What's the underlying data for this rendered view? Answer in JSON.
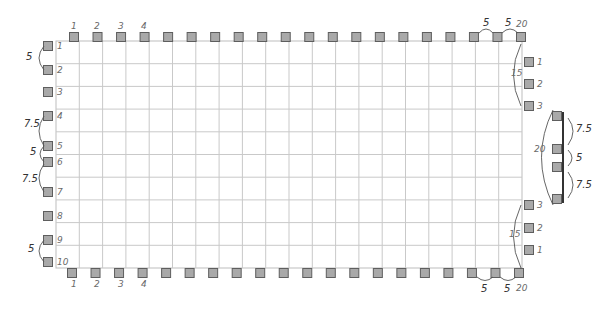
{
  "diagram": {
    "colors": {
      "square_fill": "#a9a9a9",
      "square_border": "#5e5e5e",
      "grid_line": "#c9c9c9",
      "annotation": "#333333"
    },
    "grid": {
      "columns": 20,
      "rows": 10
    },
    "top_edge": {
      "square_count": 20,
      "labels": [
        "1",
        "2",
        "3",
        "4"
      ],
      "end_annotations": [
        "5",
        "5",
        "20"
      ]
    },
    "bottom_edge": {
      "square_count": 20,
      "labels": [
        "1",
        "2",
        "3",
        "4"
      ],
      "end_annotations": [
        "5",
        "5",
        "20"
      ]
    },
    "left_edge": {
      "square_labels": [
        "1",
        "2",
        "3",
        "4",
        "5",
        "6",
        "7",
        "8",
        "9",
        "10"
      ],
      "spacing_annotations": [
        {
          "between": [
            "1",
            "2"
          ],
          "value": "5"
        },
        {
          "between": [
            "4",
            "5"
          ],
          "value": "7.5"
        },
        {
          "between": [
            "5",
            "6"
          ],
          "value": "5"
        },
        {
          "between": [
            "6",
            "7"
          ],
          "value": "7.5"
        },
        {
          "between": [
            "9",
            "10"
          ],
          "value": "5"
        }
      ]
    },
    "right_edge": {
      "upper_group": {
        "labels": [
          "1",
          "2",
          "3"
        ],
        "span_annotation": "15"
      },
      "lower_group": {
        "labels": [
          "3",
          "2",
          "1"
        ],
        "span_annotation": "15"
      }
    },
    "side_detail": {
      "span_annotation": "20",
      "spacing_annotations": [
        "7.5",
        "5",
        "7.5"
      ],
      "square_count": 4
    }
  }
}
